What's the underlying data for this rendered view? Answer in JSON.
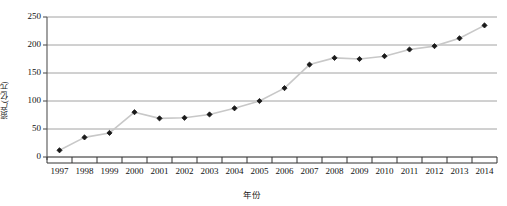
{
  "chart_data": {
    "type": "line",
    "title": "",
    "subtitle": "",
    "xlabel": "年份",
    "ylabel": "资产(亿元)",
    "categories": [
      "1997",
      "1998",
      "1999",
      "2000",
      "2001",
      "2002",
      "2003",
      "2004",
      "2005",
      "2006",
      "2007",
      "2008",
      "2009",
      "2010",
      "2011",
      "2012",
      "2013",
      "2014"
    ],
    "values": [
      12,
      35,
      43,
      80,
      69,
      70,
      76,
      87,
      100,
      123,
      165,
      177,
      175,
      180,
      192,
      198,
      212,
      235
    ],
    "series": [
      {
        "name": "资产(亿元)",
        "values": [
          12,
          35,
          43,
          80,
          69,
          70,
          76,
          87,
          100,
          123,
          165,
          177,
          175,
          180,
          192,
          198,
          212,
          235
        ]
      }
    ],
    "x": [
      "1997",
      "1998",
      "1999",
      "2000",
      "2001",
      "2002",
      "2003",
      "2004",
      "2005",
      "2006",
      "2007",
      "2008",
      "2009",
      "2010",
      "2011",
      "2012",
      "2013",
      "2014"
    ],
    "ylim": [
      0,
      250
    ],
    "yticks": [
      0,
      50,
      100,
      150,
      200,
      250
    ],
    "ytick_labels": [
      "0",
      "50",
      "100",
      "150",
      "200",
      "250"
    ],
    "grid": true,
    "grid_axis": "y",
    "legend": false,
    "legend_position": "none",
    "marker": "diamond",
    "annotations": [],
    "colors": {
      "line": "#c8c8c8",
      "marker": "#1a1a1a",
      "grid": "#8c8c8c",
      "axis": "#555555",
      "text": "#111111",
      "background": "#ffffff"
    }
  }
}
